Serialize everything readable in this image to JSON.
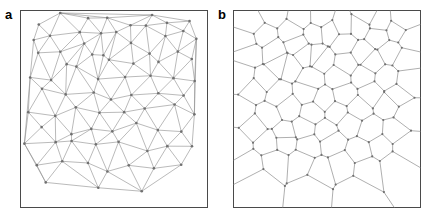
{
  "figure": {
    "width": 433,
    "height": 220,
    "background_color": "#ffffff",
    "panel_count": 2
  },
  "panels": [
    {
      "label": "a",
      "name": "delaunay-triangulation",
      "description": "Delaunay triangulation of a random planar point set",
      "box": {
        "x": 20,
        "y": 10,
        "width": 188,
        "height": 198
      },
      "border_color": "#4a4a4a",
      "edge_color": "#8c8c8c",
      "vertex_color": "#707070",
      "edge_width": 0.6,
      "vertex_radius": 1.3,
      "show_vertices": true
    },
    {
      "label": "b",
      "name": "voronoi-tessellation",
      "description": "Voronoi tessellation dual to the triangulation in panel a",
      "box": {
        "x": 233,
        "y": 10,
        "width": 188,
        "height": 198
      },
      "border_color": "#4a4a4a",
      "edge_color": "#8c8c8c",
      "vertex_color": "#707070",
      "edge_width": 0.7,
      "vertex_radius": 1.1,
      "show_vertices": true
    }
  ],
  "chart_data": {
    "type": "scatter",
    "title": "",
    "xlabel": "",
    "ylabel": "",
    "xlim": [
      0,
      1
    ],
    "ylim": [
      0,
      1
    ],
    "grid": false,
    "legend": null,
    "point_count": 78,
    "note": "Normalised seed coordinates (0-1) shared by panel a (Delaunay triangulation) and panel b (Voronoi tessellation).",
    "points": [
      [
        0.068,
        0.041
      ],
      [
        0.232,
        0.028
      ],
      [
        0.356,
        0.05
      ],
      [
        0.47,
        0.03
      ],
      [
        0.592,
        0.047
      ],
      [
        0.7,
        0.024
      ],
      [
        0.806,
        0.052
      ],
      [
        0.92,
        0.035
      ],
      [
        0.15,
        0.098
      ],
      [
        0.288,
        0.12
      ],
      [
        0.412,
        0.102
      ],
      [
        0.53,
        0.128
      ],
      [
        0.646,
        0.096
      ],
      [
        0.762,
        0.124
      ],
      [
        0.88,
        0.1
      ],
      [
        0.04,
        0.146
      ],
      [
        0.212,
        0.182
      ],
      [
        0.33,
        0.168
      ],
      [
        0.452,
        0.196
      ],
      [
        0.578,
        0.172
      ],
      [
        0.69,
        0.2
      ],
      [
        0.838,
        0.178
      ],
      [
        0.952,
        0.16
      ],
      [
        0.108,
        0.238
      ],
      [
        0.252,
        0.256
      ],
      [
        0.382,
        0.23
      ],
      [
        0.5,
        0.262
      ],
      [
        0.624,
        0.242
      ],
      [
        0.746,
        0.27
      ],
      [
        0.896,
        0.246
      ],
      [
        0.032,
        0.32
      ],
      [
        0.17,
        0.336
      ],
      [
        0.3,
        0.308
      ],
      [
        0.43,
        0.342
      ],
      [
        0.556,
        0.318
      ],
      [
        0.672,
        0.348
      ],
      [
        0.8,
        0.324
      ],
      [
        0.94,
        0.338
      ],
      [
        0.094,
        0.412
      ],
      [
        0.232,
        0.428
      ],
      [
        0.366,
        0.4
      ],
      [
        0.486,
        0.436
      ],
      [
        0.61,
        0.408
      ],
      [
        0.73,
        0.442
      ],
      [
        0.862,
        0.418
      ],
      [
        0.046,
        0.498
      ],
      [
        0.18,
        0.512
      ],
      [
        0.312,
        0.486
      ],
      [
        0.442,
        0.52
      ],
      [
        0.566,
        0.494
      ],
      [
        0.688,
        0.524
      ],
      [
        0.812,
        0.5
      ],
      [
        0.934,
        0.516
      ],
      [
        0.112,
        0.592
      ],
      [
        0.248,
        0.608
      ],
      [
        0.378,
        0.578
      ],
      [
        0.506,
        0.614
      ],
      [
        0.632,
        0.586
      ],
      [
        0.756,
        0.618
      ],
      [
        0.884,
        0.594
      ],
      [
        0.036,
        0.676
      ],
      [
        0.166,
        0.694
      ],
      [
        0.296,
        0.664
      ],
      [
        0.424,
        0.7
      ],
      [
        0.548,
        0.672
      ],
      [
        0.676,
        0.704
      ],
      [
        0.804,
        0.678
      ],
      [
        0.93,
        0.692
      ],
      [
        0.09,
        0.78
      ],
      [
        0.226,
        0.796
      ],
      [
        0.358,
        0.766
      ],
      [
        0.482,
        0.802
      ],
      [
        0.606,
        0.774
      ],
      [
        0.734,
        0.806
      ],
      [
        0.86,
        0.78
      ],
      [
        0.148,
        0.896
      ],
      [
        0.404,
        0.912
      ],
      [
        0.668,
        0.898
      ]
    ]
  }
}
